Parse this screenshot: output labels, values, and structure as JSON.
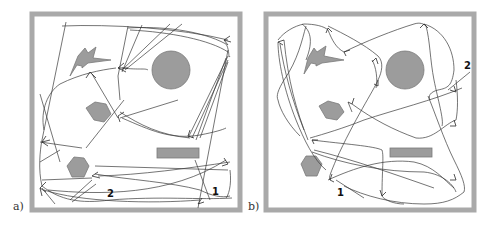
{
  "figure": {
    "panels": [
      {
        "id": "a",
        "label": "a)",
        "markers": [
          {
            "text": "1",
            "x": 212,
            "y": 195
          },
          {
            "text": "2",
            "x": 107,
            "y": 197
          }
        ],
        "obstacles": [
          "lightning-shape",
          "circle",
          "hexagon-upper",
          "hexagon-lower",
          "rectangle"
        ]
      },
      {
        "id": "b",
        "label": "b)",
        "markers": [
          {
            "text": "1",
            "x": 93,
            "y": 196
          },
          {
            "text": "2",
            "x": 220,
            "y": 69
          }
        ],
        "obstacles": [
          "lightning-shape",
          "circle",
          "hexagon-upper",
          "hexagon-lower",
          "rectangle"
        ]
      }
    ],
    "colors": {
      "frame": "#a9a9a9",
      "obstacle_fill": "#9c9c9c",
      "trajectory": "#3a3a3a"
    }
  }
}
